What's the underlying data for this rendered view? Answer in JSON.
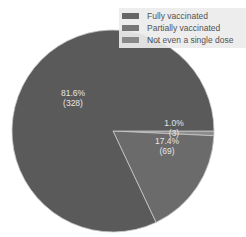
{
  "chart_data": {
    "type": "pie",
    "title": "",
    "categories": [
      "Fully vaccinated",
      "Partially vaccinated",
      "Not even a single dose"
    ],
    "values": [
      328,
      69,
      3
    ],
    "percentages": [
      "81.6%",
      "17.4%",
      "1.0%"
    ],
    "labels": {
      "fully": {
        "pct": "81.6%",
        "count": "(328)"
      },
      "partially": {
        "pct": "17.4%",
        "count": "(69)"
      },
      "none": {
        "pct": "1.0%",
        "count": "(3)"
      }
    },
    "colors": {
      "fully": "#5a5a5a",
      "partially": "#6b6b6b",
      "none": "#8c8c8c",
      "edge": "#c8c8c8"
    },
    "legend": {
      "position": "upper right",
      "entries": [
        "Fully vaccinated",
        "Partially vaccinated",
        "Not even a single dose"
      ]
    }
  }
}
